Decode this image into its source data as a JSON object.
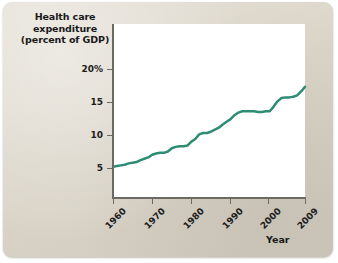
{
  "figure": {
    "background_color": "#ddd7cb",
    "plot_background_color": "#ffffff",
    "axis_color": "#6d6a63"
  },
  "chart_data": {
    "type": "line",
    "title": "",
    "ylabel": "Health care expenditure (percent of GDP)",
    "ylabel_lines": [
      "Health care",
      "expenditure",
      "(percent of GDP)"
    ],
    "xlabel": "Year",
    "xlim": [
      1960,
      2009
    ],
    "ylim": [
      0,
      21.5
    ],
    "grid": false,
    "legend": null,
    "line_color": "#2e8b74",
    "line_width": 2.5,
    "ytick_labels": [
      "20%",
      "15",
      "10",
      "5"
    ],
    "ytick_values": [
      20,
      15,
      10,
      5
    ],
    "xtick_labels": [
      "1960",
      "1970",
      "1980",
      "1990",
      "2000",
      "2009"
    ],
    "xtick_values": [
      1960,
      1970,
      1980,
      1990,
      2000,
      2009
    ],
    "x": [
      1960,
      1961,
      1962,
      1963,
      1964,
      1965,
      1966,
      1967,
      1968,
      1969,
      1970,
      1971,
      1972,
      1973,
      1974,
      1975,
      1976,
      1977,
      1978,
      1979,
      1980,
      1981,
      1982,
      1983,
      1984,
      1985,
      1986,
      1987,
      1988,
      1989,
      1990,
      1991,
      1992,
      1993,
      1994,
      1995,
      1996,
      1997,
      1998,
      1999,
      2000,
      2001,
      2002,
      2003,
      2004,
      2005,
      2006,
      2007,
      2008,
      2009
    ],
    "values": [
      5.2,
      5.3,
      5.4,
      5.5,
      5.7,
      5.8,
      5.9,
      6.2,
      6.4,
      6.6,
      7.0,
      7.2,
      7.3,
      7.3,
      7.5,
      8.0,
      8.2,
      8.3,
      8.3,
      8.4,
      9.0,
      9.4,
      10.1,
      10.3,
      10.3,
      10.5,
      10.8,
      11.1,
      11.6,
      12.0,
      12.4,
      13.0,
      13.4,
      13.6,
      13.6,
      13.6,
      13.6,
      13.5,
      13.5,
      13.6,
      13.6,
      14.3,
      15.1,
      15.6,
      15.7,
      15.7,
      15.8,
      16.0,
      16.6,
      17.3
    ]
  }
}
